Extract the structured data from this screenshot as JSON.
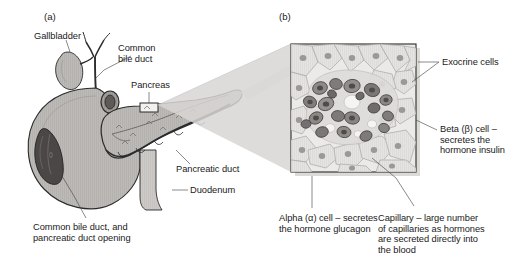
{
  "figure": {
    "background_color": "#ffffff",
    "ink_color": "#1a1a1a",
    "panels": [
      {
        "id": "a",
        "letter": "(a)",
        "caption": "Anatomy of the pancreas, gallbladder and duodenum"
      },
      {
        "id": "b",
        "letter": "(b)",
        "caption": "Micrograph of a pancreatic islet of Langerhans"
      }
    ]
  },
  "panel_a": {
    "letter": "(a)",
    "labels": {
      "gallbladder": "Gallbladder",
      "common_bile_duct": "Common\nbile duct",
      "pancreas": "Pancreas",
      "pancreatic_duct": "Pancreatic duct",
      "duodenum": "Duodenum",
      "cbd_opening": "Common bile duct, and\npancreatic duct opening"
    },
    "structures": [
      "gallbladder",
      "cystic-duct",
      "common-hepatic-duct",
      "common-bile-duct",
      "duodenum",
      "pancreas-head",
      "pancreas-body",
      "pancreas-tail",
      "pancreatic-duct",
      "duodenal-cutaway-window",
      "magnified-region-marker"
    ],
    "colors": {
      "organ_fill": "#b9b7b4",
      "organ_fill_light": "#c9c7c4",
      "organ_outline": "#2b2b2b",
      "cutaway_dark": "#4a4746",
      "duct_fill": "#a8a6a3"
    }
  },
  "panel_b": {
    "letter": "(b)",
    "labels": {
      "exocrine_cells": "Exocrine cells",
      "beta_cell": "Beta (β) cell –\nsecretes the\nhormone insulin",
      "alpha_cell": "Alpha (α) cell – secretes\nthe hormone glucagon",
      "capillary": "Capillary – large number\nof capillaries as hormones\nare secreted directly into\nthe blood"
    },
    "micrograph": {
      "frame_color": "#3a3a3a",
      "background_color": "#eceae8",
      "islet_cell_color": "#8f8c8a",
      "islet_cell_dark_color": "#6e6b69",
      "exocrine_cell_color": "#d2d0ce",
      "capillary_color": "#f4f2f0",
      "nucleus_color": "#555250"
    },
    "magnification_wedge_color": "#d8d6d3"
  }
}
